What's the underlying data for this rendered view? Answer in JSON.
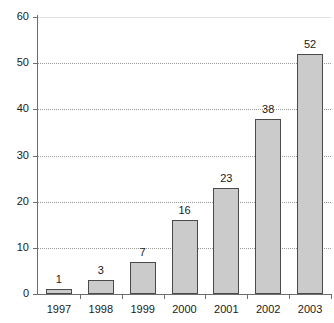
{
  "chart_data": {
    "type": "bar",
    "title": "",
    "subtitle": "",
    "xlabel": "",
    "ylabel": "",
    "categories": [
      "1997",
      "1998",
      "1999",
      "2000",
      "2001",
      "2002",
      "2003"
    ],
    "values": [
      1,
      3,
      7,
      16,
      23,
      38,
      52
    ],
    "data_labels": [
      "1",
      "3",
      "7",
      "16",
      "23",
      "38",
      "52"
    ],
    "ylim": [
      0,
      60
    ],
    "y_ticks": [
      0,
      10,
      20,
      30,
      40,
      50,
      60
    ],
    "y_tick_labels": [
      "0",
      "10",
      "20",
      "30",
      "40",
      "50",
      "60"
    ],
    "grid": true,
    "grid_axis": "y",
    "grid_style": "dotted",
    "legend": false,
    "legend_position": "none",
    "bar_fill_color": "#cbcbcb",
    "bar_border_color": "#4a4a4a",
    "grid_color": "#9a9a9a",
    "axis_color": "#6e6e6e",
    "text_color": "#1a1a1a",
    "background_color": "#ffffff"
  }
}
